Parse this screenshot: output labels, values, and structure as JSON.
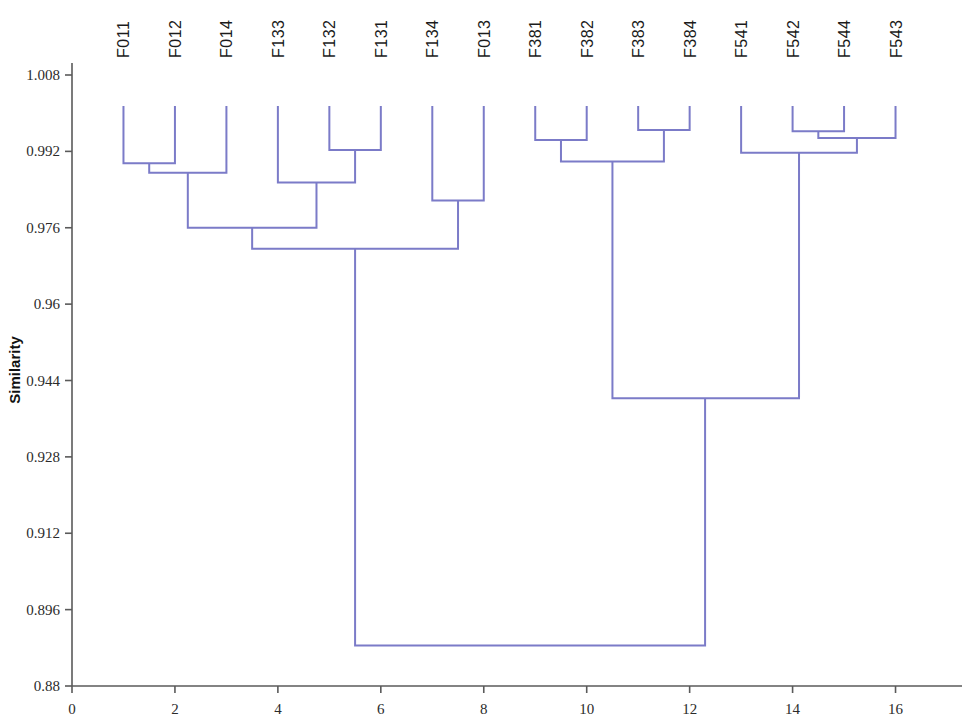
{
  "chart_data": {
    "type": "line",
    "subtype": "dendrogram",
    "title": "",
    "xlabel": "",
    "ylabel": "Similarity",
    "orientation": "vertical-leaves-top",
    "grid": false,
    "legend": null,
    "line_color": "#7b7bc8",
    "axis_color": "#5a5a5a",
    "background": "#ffffff",
    "xlim": [
      0,
      17
    ],
    "ylim": [
      0.88,
      1.012
    ],
    "xticks": [
      0,
      2,
      4,
      6,
      8,
      10,
      12,
      14,
      16
    ],
    "xtick_labels": [
      "0",
      "2",
      "4",
      "6",
      "8",
      "10",
      "12",
      "14",
      "16"
    ],
    "yticks": [
      1.008,
      0.992,
      0.976,
      0.96,
      0.944,
      0.928,
      0.912,
      0.896,
      0.88
    ],
    "ytick_labels": [
      "1.008",
      "0.992",
      "0.976",
      "0.96",
      "0.944",
      "0.928",
      "0.912",
      "0.896",
      "0.88"
    ],
    "leaf_positions": [
      1,
      2,
      3,
      4,
      5,
      6,
      7,
      8,
      9,
      10,
      11,
      12,
      13,
      14,
      15,
      16
    ],
    "leaf_labels": [
      "F011",
      "F012",
      "F014",
      "F133",
      "F132",
      "F131",
      "F134",
      "F013",
      "F381",
      "F382",
      "F383",
      "F384",
      "F541",
      "F542",
      "F544",
      "F543"
    ],
    "leaf_top_similarity": 1.0015,
    "merges": [
      {
        "id": "m1",
        "label": "F011 + F012",
        "left_x": 1,
        "right_x": 2,
        "similarity": 0.9895,
        "left_from": 1.0015,
        "right_from": 1.0015
      },
      {
        "id": "m2",
        "label": "(F011,F012) + F014",
        "left_x": 1.5,
        "right_x": 3,
        "similarity": 0.9875,
        "left_from": 0.9895,
        "right_from": 1.0015
      },
      {
        "id": "m3",
        "label": "F132 + F131",
        "left_x": 5,
        "right_x": 6,
        "similarity": 0.9923,
        "left_from": 1.0015,
        "right_from": 1.0015
      },
      {
        "id": "m4",
        "label": "F133 + (F132,F131)",
        "left_x": 4,
        "right_x": 5.5,
        "similarity": 0.9855,
        "left_from": 1.0015,
        "right_from": 0.9923
      },
      {
        "id": "m5",
        "label": "(F011,F012,F014) + (F133,F132,F131)",
        "left_x": 2.25,
        "right_x": 4.75,
        "similarity": 0.976,
        "left_from": 0.9875,
        "right_from": 0.9855
      },
      {
        "id": "m6",
        "label": "F134 + F013",
        "left_x": 7,
        "right_x": 8,
        "similarity": 0.9817,
        "left_from": 1.0015,
        "right_from": 1.0015
      },
      {
        "id": "m7",
        "label": "cluster-F0/F1 root",
        "left_x": 3.5,
        "right_x": 7.5,
        "similarity": 0.9716,
        "left_from": 0.976,
        "right_from": 0.9817
      },
      {
        "id": "m8",
        "label": "F381 + F382",
        "left_x": 9,
        "right_x": 10,
        "similarity": 0.9944,
        "left_from": 1.0015,
        "right_from": 1.0015
      },
      {
        "id": "m9",
        "label": "F383 + F384",
        "left_x": 11,
        "right_x": 12,
        "similarity": 0.9965,
        "left_from": 1.0015,
        "right_from": 1.0015
      },
      {
        "id": "m10",
        "label": "(F381,F382) + (F383,F384)",
        "left_x": 9.5,
        "right_x": 11.5,
        "similarity": 0.9899,
        "left_from": 0.9944,
        "right_from": 0.9965
      },
      {
        "id": "m11",
        "label": "F542 + F544",
        "left_x": 14,
        "right_x": 15,
        "similarity": 0.9962,
        "left_from": 1.0015,
        "right_from": 1.0015
      },
      {
        "id": "m12",
        "label": "(F542,F544) + F543",
        "left_x": 14.5,
        "right_x": 16,
        "similarity": 0.9948,
        "left_from": 0.9962,
        "right_from": 1.0015
      },
      {
        "id": "m13",
        "label": "F541 + (F542,F544,F543)",
        "left_x": 13,
        "right_x": 15.25,
        "similarity": 0.9917,
        "left_from": 1.0015,
        "right_from": 0.9948
      },
      {
        "id": "m14",
        "label": "F38x + F54x",
        "left_x": 10.5,
        "right_x": 14.125,
        "similarity": 0.9403,
        "left_from": 0.9899,
        "right_from": 0.9917
      },
      {
        "id": "m15",
        "label": "root",
        "left_x": 5.5,
        "right_x": 12.3,
        "similarity": 0.8885,
        "left_from": 0.9716,
        "right_from": 0.9403
      }
    ]
  }
}
